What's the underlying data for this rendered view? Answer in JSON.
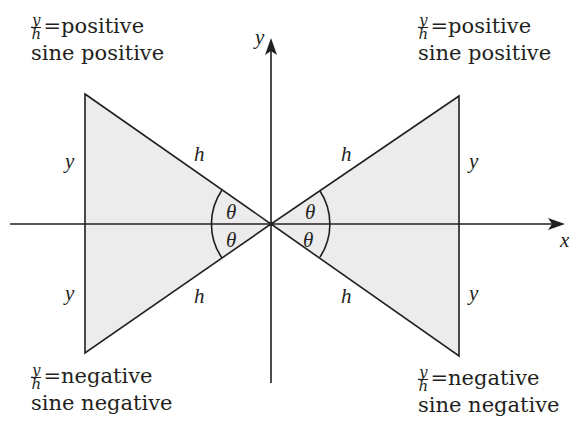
{
  "diagram": {
    "axes": {
      "x_label": "x",
      "y_label": "y",
      "origin": [
        271,
        224
      ]
    },
    "colors": {
      "line": "#231f20",
      "fill": "#ececec",
      "background": "#ffffff"
    },
    "triangles": [
      {
        "id": "upper-left",
        "opposite_label": "y",
        "hypotenuse_label": "h",
        "angle_label": "θ"
      },
      {
        "id": "upper-right",
        "opposite_label": "y",
        "hypotenuse_label": "h",
        "angle_label": "θ"
      },
      {
        "id": "lower-left",
        "opposite_label": "y",
        "hypotenuse_label": "h",
        "angle_label": "θ"
      },
      {
        "id": "lower-right",
        "opposite_label": "y",
        "hypotenuse_label": "h",
        "angle_label": "θ"
      }
    ],
    "quadrant_labels": {
      "upper_left": {
        "frac_num": "y",
        "frac_den": "h",
        "equals": "=",
        "value": "positive",
        "line2": "sine positive"
      },
      "upper_right": {
        "frac_num": "y",
        "frac_den": "h",
        "equals": "=",
        "value": "positive",
        "line2": "sine positive"
      },
      "lower_left": {
        "frac_num": "y",
        "frac_den": "h",
        "equals": "=",
        "value": "negative",
        "line2": "sine negative"
      },
      "lower_right": {
        "frac_num": "y",
        "frac_den": "h",
        "equals": "=",
        "value": "negative",
        "line2": "sine negative"
      }
    }
  }
}
